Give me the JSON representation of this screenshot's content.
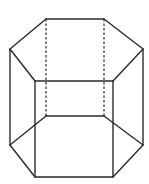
{
  "diagram": {
    "shape": "hexagonal-prism",
    "colors": {
      "background": "#ffffff",
      "stroke": "#2b2b2b"
    },
    "vertices": {
      "top_back_left": [
        46,
        19
      ],
      "top_back_right": [
        104,
        19
      ],
      "top_right": [
        143,
        49
      ],
      "top_front_right": [
        113,
        81
      ],
      "top_front_left": [
        35,
        81
      ],
      "top_left": [
        10,
        49
      ],
      "bottom_back_left": [
        46,
        116
      ],
      "bottom_back_right": [
        104,
        116
      ],
      "bottom_right": [
        143,
        145
      ],
      "bottom_front_right": [
        113,
        177
      ],
      "bottom_front_left": [
        35,
        177
      ],
      "bottom_left": [
        10,
        145
      ]
    },
    "solid_edges": [
      [
        "top_back_left",
        "top_back_right"
      ],
      [
        "top_back_right",
        "top_right"
      ],
      [
        "top_right",
        "top_front_right"
      ],
      [
        "top_front_right",
        "top_front_left"
      ],
      [
        "top_front_left",
        "top_left"
      ],
      [
        "top_left",
        "top_back_left"
      ],
      [
        "top_left",
        "bottom_left"
      ],
      [
        "top_front_left",
        "bottom_front_left"
      ],
      [
        "top_front_right",
        "bottom_front_right"
      ],
      [
        "top_right",
        "bottom_right"
      ],
      [
        "bottom_left",
        "bottom_front_left"
      ],
      [
        "bottom_front_left",
        "bottom_front_right"
      ],
      [
        "bottom_front_right",
        "bottom_right"
      ],
      [
        "bottom_left",
        "bottom_back_left"
      ],
      [
        "bottom_back_left",
        "bottom_back_right"
      ],
      [
        "bottom_back_right",
        "bottom_right"
      ]
    ],
    "hidden_edges": [
      [
        "top_back_left",
        "bottom_back_left"
      ],
      [
        "top_back_right",
        "bottom_back_right"
      ]
    ]
  }
}
